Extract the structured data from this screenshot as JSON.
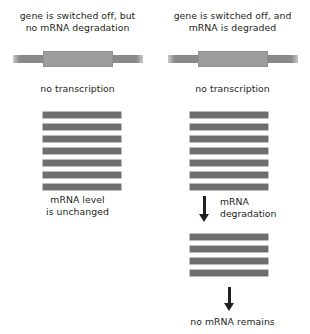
{
  "figure": {
    "colors": {
      "text": "#231f20",
      "gene_center": "#9d9d9d",
      "gene_ends": "#8a8a8a",
      "mrna": "#6e6e6e",
      "arrow": "#231f20",
      "background": "#ffffff"
    }
  },
  "panels": [
    {
      "id": "left",
      "heading_line1": "gene is switched off, but",
      "heading_line2": "no mRNA degradation",
      "gene_label": "gene-bar",
      "transcription_label": "no transcription",
      "mrna_count": 7,
      "result_line1": "mRNA level",
      "result_line2": "is unchanged"
    },
    {
      "id": "right",
      "heading_line1": "gene is switched off, and",
      "heading_line2": "mRNA is degraded",
      "gene_label": "gene-bar",
      "transcription_label": "no transcription",
      "mrna_count": 7,
      "degradation_label_line1": "mRNA",
      "degradation_label_line2": "degradation",
      "mrna_count_after": 4,
      "result_line1": "no mRNA remains"
    }
  ]
}
